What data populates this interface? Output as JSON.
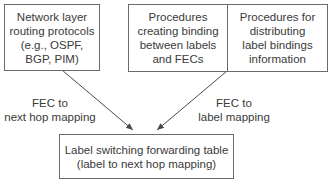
{
  "diagram": {
    "boxes": {
      "routing_protocols": {
        "text": "Network layer\nrouting protocols\n(e.g., OSPF,\nBGP, PIM)"
      },
      "binding_procedures": {
        "text": "Procedures\ncreating binding\nbetween labels\nand FECs"
      },
      "distribution_procedures": {
        "text": "Procedures for\ndistributing\nlabel bindings\ninformation"
      },
      "forwarding_table": {
        "text": "Label switching forwarding table\n(label to next hop mapping)"
      }
    },
    "edges": {
      "left": {
        "label": "FEC to\nnext hop mapping",
        "from": "routing_protocols",
        "to": "forwarding_table"
      },
      "right": {
        "label": "FEC to\nlabel mapping",
        "from": "binding_procedures",
        "to": "forwarding_table"
      }
    },
    "colors": {
      "line": "#4a4a4a",
      "border": "#6a6a6a",
      "text": "#3a3a3a"
    }
  }
}
